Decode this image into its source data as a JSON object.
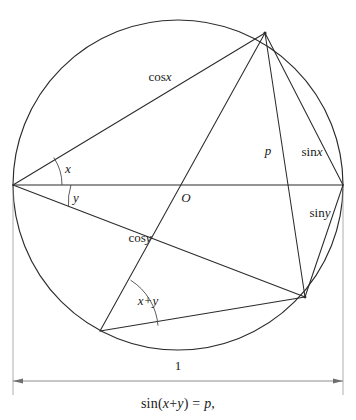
{
  "figure": {
    "type": "geometry-diagram",
    "caption": "sin(x+y) = p,",
    "caption_parts": {
      "fn": "sin",
      "open": "(",
      "arg_x": "x",
      "plus": "+",
      "arg_y": "y",
      "close": ")",
      "equals": "=",
      "value": "p",
      "comma": ","
    },
    "circle": {
      "cx": 178,
      "cy": 185,
      "r": 165,
      "diameter_label": "1"
    },
    "center_label": "O",
    "vertices": {
      "left": {
        "name": "A",
        "x": 13,
        "y": 185
      },
      "top": {
        "name": "B",
        "x": 265,
        "y": 33
      },
      "right": {
        "name": "C",
        "x": 343,
        "y": 185
      },
      "bottom_right": {
        "name": "D",
        "x": 305,
        "y": 297
      },
      "bottom_left": {
        "name": "E",
        "x": 100,
        "y": 331
      }
    },
    "segment_labels": [
      {
        "id": "cos-x",
        "base": "cos",
        "sub": "x",
        "x": 160,
        "y": 78
      },
      {
        "id": "cos-y",
        "base": "cos",
        "sub": "y",
        "x": 140,
        "y": 239
      },
      {
        "id": "sin-x",
        "base": "sin",
        "sub": "x",
        "x": 312,
        "y": 153
      },
      {
        "id": "sin-y",
        "base": "sin",
        "sub": "y",
        "x": 320,
        "y": 214
      },
      {
        "id": "p",
        "base": "",
        "sub": "p",
        "x": 268,
        "y": 152
      }
    ],
    "angle_labels": [
      {
        "id": "angle-x",
        "text": "x",
        "x": 68,
        "y": 170
      },
      {
        "id": "angle-y",
        "text": "y",
        "x": 76,
        "y": 199
      },
      {
        "id": "angle-xy",
        "text": "x+y",
        "x": 148,
        "y": 302
      }
    ],
    "dimension": {
      "label": "1",
      "label_x": 178,
      "label_y": 367,
      "line_y": 381,
      "x_start": 13,
      "x_end": 343
    },
    "colors": {
      "line": "#2b2b2b",
      "arc": "#4a4a4a",
      "dimension": "#6e6e6e",
      "extension": "#9a9a9a",
      "text": "#1a1a1a",
      "background": "#ffffff"
    }
  }
}
